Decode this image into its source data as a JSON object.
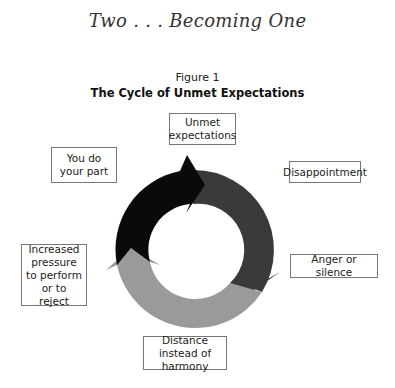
{
  "header": {
    "title": "Two . . . Becoming One"
  },
  "figure": {
    "number": "Figure 1",
    "title": "The Cycle of Unmet Expectations"
  },
  "cycle": {
    "colors": {
      "segment_black": "#0a0a0a",
      "segment_dark_gray": "#3a3a3a",
      "segment_light_gray": "#9a9a9a"
    },
    "labels": {
      "unmet_expectations": "Unmet expectations",
      "disappointment": "Disappointment",
      "anger_or_silence": "Anger or silence",
      "distance_instead_of_harmony": "Distance instead of harmony",
      "increased_pressure": "Increased pressure to perform or to reject",
      "you_do_your_part": "You do your part"
    }
  }
}
